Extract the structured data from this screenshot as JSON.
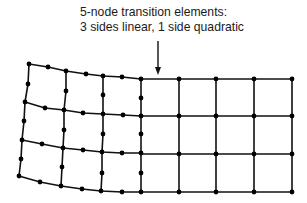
{
  "caption": {
    "line1": "5-node transition elements:",
    "line2": "3 sides linear, 1 side quadratic"
  },
  "colors": {
    "line": "#111111",
    "node": "#000000",
    "background": "#ffffff"
  },
  "arrow": {
    "x": 158,
    "y1": 41,
    "y2": 75
  },
  "quadratic_region": {
    "rows": [
      [
        [
          29,
          64
        ],
        [
          48,
          67
        ],
        [
          66,
          71
        ],
        [
          86,
          74
        ],
        [
          103,
          76
        ],
        [
          122,
          77
        ],
        [
          141,
          79
        ]
      ],
      [
        [
          25,
          102
        ],
        [
          45,
          108
        ],
        [
          64,
          110
        ],
        [
          83,
          113
        ],
        [
          103,
          114
        ],
        [
          123,
          115
        ],
        [
          141,
          116
        ]
      ],
      [
        [
          22,
          140
        ],
        [
          42,
          144
        ],
        [
          63,
          148
        ],
        [
          83,
          150
        ],
        [
          102,
          152
        ],
        [
          122,
          153
        ],
        [
          141,
          153
        ]
      ],
      [
        [
          19,
          176
        ],
        [
          40,
          182
        ],
        [
          61,
          186
        ],
        [
          82,
          189
        ],
        [
          101,
          191
        ],
        [
          122,
          192
        ],
        [
          141,
          192
        ]
      ]
    ],
    "vertical_mid_nodes": [
      [
        [
          28,
          84
        ],
        [
          66,
          91
        ],
        [
          103,
          95
        ],
        [
          141,
          98
        ]
      ],
      [
        [
          24,
          121
        ],
        [
          64,
          130
        ],
        [
          103,
          134
        ],
        [
          141,
          134
        ]
      ],
      [
        [
          21,
          159
        ],
        [
          62,
          167
        ],
        [
          102,
          173
        ],
        [
          141,
          173
        ]
      ]
    ]
  },
  "linear_region": {
    "columns_x": [
      141,
      179,
      216,
      254,
      292
    ],
    "rows_y": [
      79,
      116,
      154,
      192
    ]
  }
}
